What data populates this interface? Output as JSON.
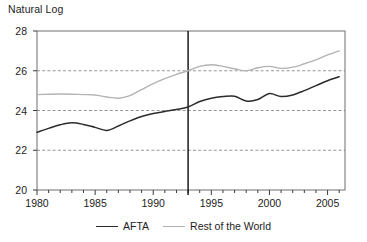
{
  "chart_data": {
    "type": "line",
    "title": "",
    "ylabel": "Natural Log",
    "xlabel": "",
    "xlim": [
      1980,
      2006.5
    ],
    "ylim": [
      20,
      28
    ],
    "yticks": [
      20,
      22,
      24,
      26,
      28
    ],
    "xticks": [
      1980,
      1985,
      1990,
      1995,
      2000,
      2005
    ],
    "xtick_minor_step": 1,
    "grid": "horizontal dashed gridlines at 22, 24, 26",
    "legend_position": "bottom-center",
    "annotations": [
      {
        "type": "vertical-line",
        "x": 1993,
        "label": ""
      }
    ],
    "x": [
      1980,
      1981,
      1982,
      1983,
      1984,
      1985,
      1986,
      1987,
      1988,
      1989,
      1990,
      1991,
      1992,
      1993,
      1994,
      1995,
      1996,
      1997,
      1998,
      1999,
      2000,
      2001,
      2002,
      2003,
      2004,
      2005,
      2006
    ],
    "series": [
      {
        "name": "AFTA",
        "color": "#2b2b2b",
        "values": [
          22.9,
          23.1,
          23.28,
          23.38,
          23.3,
          23.15,
          23.0,
          23.22,
          23.48,
          23.7,
          23.85,
          23.95,
          24.05,
          24.18,
          24.45,
          24.62,
          24.7,
          24.72,
          24.48,
          24.55,
          24.85,
          24.7,
          24.78,
          25.0,
          25.25,
          25.5,
          25.7
        ]
      },
      {
        "name": "Rest of the World",
        "color": "#b3b3b3",
        "values": [
          24.8,
          24.82,
          24.83,
          24.82,
          24.8,
          24.78,
          24.68,
          24.62,
          24.75,
          25.05,
          25.35,
          25.6,
          25.82,
          26.0,
          26.22,
          26.3,
          26.22,
          26.1,
          26.0,
          26.15,
          26.22,
          26.12,
          26.18,
          26.35,
          26.55,
          26.8,
          27.0
        ]
      }
    ]
  },
  "y_axis": {
    "ticks": [
      "20",
      "22",
      "24",
      "26",
      "28"
    ]
  },
  "x_axis": {
    "ticks": [
      "1980",
      "1985",
      "1990",
      "1995",
      "2000",
      "2005"
    ]
  },
  "legend": {
    "entries": [
      {
        "label": "AFTA",
        "color": "#2b2b2b"
      },
      {
        "label": "Rest of the World",
        "color": "#b3b3b3"
      }
    ]
  },
  "labels": {
    "y_axis_title": "Natural Log"
  }
}
